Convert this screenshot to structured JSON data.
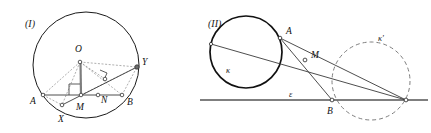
{
  "figures": [
    {
      "id": "figure-1",
      "caption": "(I)",
      "caption_pos": {
        "x": 25,
        "y": 27
      },
      "circle": {
        "cx": 86,
        "cy": 65,
        "r": 53,
        "stroke": "#1a1a1a",
        "width": 1.0
      },
      "points": [
        {
          "name": "O",
          "x": 80,
          "y": 62,
          "label": "O",
          "lx": 75,
          "ly": 52,
          "marker": "open"
        },
        {
          "name": "A",
          "x": 43,
          "y": 95,
          "label": "A",
          "lx": 30,
          "ly": 104,
          "marker": "open"
        },
        {
          "name": "B",
          "x": 122,
          "y": 95,
          "label": "B",
          "lx": 127,
          "ly": 105,
          "marker": "open"
        },
        {
          "name": "M",
          "x": 81,
          "y": 95,
          "label": "M",
          "lx": 76,
          "ly": 110,
          "marker": "open"
        },
        {
          "name": "N",
          "x": 98,
          "y": 95,
          "label": "N",
          "lx": 101,
          "ly": 103,
          "marker": "open"
        },
        {
          "name": "X",
          "x": 62,
          "y": 105,
          "label": "X",
          "lx": 58,
          "ly": 122,
          "marker": "open"
        },
        {
          "name": "Y",
          "x": 137,
          "y": 67,
          "label": "Y",
          "lx": 142,
          "ly": 65,
          "marker": "filled"
        },
        {
          "name": "P",
          "x": 105,
          "y": 79,
          "label": "",
          "lx": 0,
          "ly": 0,
          "marker": "open"
        }
      ],
      "solid_segments": [
        {
          "from": "A",
          "to": "B",
          "desc": "chord-AB"
        },
        {
          "from": "X",
          "to": "Y",
          "desc": "chord-XY"
        },
        {
          "from": "O",
          "to": "M",
          "desc": "radius-OM"
        }
      ],
      "dashed_segments": [
        {
          "from": "O",
          "to": "A",
          "desc": "radius-OA"
        },
        {
          "from": "O",
          "to": "B",
          "desc": "radius-OB"
        },
        {
          "from": "O",
          "to": "X",
          "desc": "radius-OX"
        },
        {
          "from": "O",
          "to": "Y",
          "desc": "radius-OY"
        },
        {
          "from": "O",
          "to": "P",
          "desc": "perpendicular-OP"
        },
        {
          "from": "A",
          "to": "X",
          "desc": "segment-AX"
        },
        {
          "from": "M",
          "to": "Y",
          "desc": "segment-MY"
        },
        {
          "from": "B",
          "to": "Y",
          "desc": "segment-BY"
        }
      ],
      "right_angles": [
        {
          "at": "M",
          "desc": "right-angle-at-M"
        },
        {
          "at": "P",
          "desc": "right-angle-at-P"
        }
      ]
    },
    {
      "id": "figure-2",
      "caption": "(II)",
      "caption_pos": {
        "x": 208,
        "y": 27
      },
      "circles": [
        {
          "name": "kappa",
          "label": "κ",
          "lx": 226,
          "ly": 73,
          "cx": 246,
          "cy": 52,
          "r": 36,
          "style": "solid",
          "stroke": "#111111",
          "width": 1.6
        },
        {
          "name": "kappa-prime",
          "label": "κ'",
          "lx": 378,
          "ly": 41,
          "cx": 371,
          "cy": 81,
          "r": 39,
          "style": "dashed",
          "stroke": "#6a6a6a",
          "width": 1.0
        }
      ],
      "line": {
        "name": "epsilon",
        "label": "ε",
        "lx": 289,
        "ly": 97,
        "x1": 200,
        "y1": 100,
        "x2": 428,
        "y2": 100,
        "stroke": "#555555",
        "width": 1.6
      },
      "points": [
        {
          "name": "A",
          "x": 280,
          "y": 38,
          "label": "A",
          "lx": 286,
          "ly": 34,
          "marker": "open"
        },
        {
          "name": "M",
          "x": 305,
          "y": 60,
          "label": "M",
          "lx": 311,
          "ly": 58,
          "marker": "open"
        },
        {
          "name": "B",
          "x": 332,
          "y": 100,
          "label": "B",
          "lx": 327,
          "ly": 114,
          "marker": "open"
        },
        {
          "name": "L",
          "x": 211,
          "y": 44,
          "label": "",
          "lx": 0,
          "ly": 0,
          "marker": "open"
        },
        {
          "name": "R",
          "x": 406,
          "y": 100,
          "label": "",
          "lx": 0,
          "ly": 0,
          "marker": "open"
        }
      ],
      "solid_segments": [
        {
          "from": "L",
          "to": "R",
          "desc": "transversal-through-both-circles"
        },
        {
          "from": "A",
          "to": "B",
          "desc": "chord-AB"
        },
        {
          "from": "A",
          "to": "R",
          "desc": "secant-A-to-right"
        }
      ]
    }
  ],
  "colors": {
    "ink": "#1a1a1a",
    "dashed_gray": "#8a8a8a",
    "line_gray": "#555555",
    "background": "#ffffff"
  }
}
